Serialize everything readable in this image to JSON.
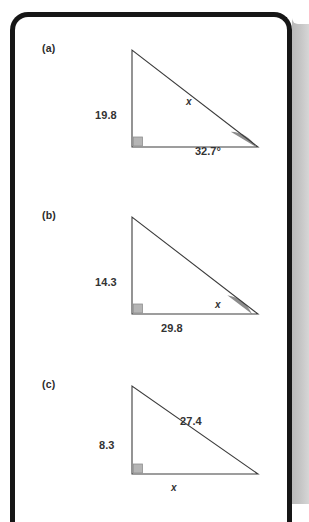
{
  "page": {
    "type": "scanned-textbook-page",
    "background_color": "#ffffff",
    "frame_color": "#161616",
    "edge_shadow_color": "#c4c4c4"
  },
  "style": {
    "line_color": "#3c3c3c",
    "arc_fill": "#8c8c8c",
    "right_angle_fill": "#b5b5b5",
    "right_angle_stroke": "#8f8f8f",
    "text_color": "#333333"
  },
  "figures": [
    {
      "id": "figure-a",
      "label": "(a)",
      "shape": "right-triangle",
      "right_angle_position": "bottom-left",
      "vertical_leg_label": "19.8",
      "horizontal_leg_label": "",
      "hypotenuse_label": "x",
      "angle_label": "32.7°",
      "angle_position": "bottom-right",
      "angle_shaded": true,
      "unknown": "hypotenuse"
    },
    {
      "id": "figure-b",
      "label": "(b)",
      "shape": "right-triangle",
      "right_angle_position": "bottom-left",
      "vertical_leg_label": "14.3",
      "horizontal_leg_label": "29.8",
      "hypotenuse_label": "",
      "angle_label": "x",
      "angle_position": "bottom-right",
      "angle_shaded": true,
      "unknown": "angle"
    },
    {
      "id": "figure-c",
      "label": "(c)",
      "shape": "right-triangle",
      "right_angle_position": "bottom-left",
      "vertical_leg_label": "8.3",
      "horizontal_leg_label": "x",
      "hypotenuse_label": "27.4",
      "angle_label": "",
      "angle_position": "",
      "angle_shaded": false,
      "unknown": "horizontal-leg"
    }
  ]
}
